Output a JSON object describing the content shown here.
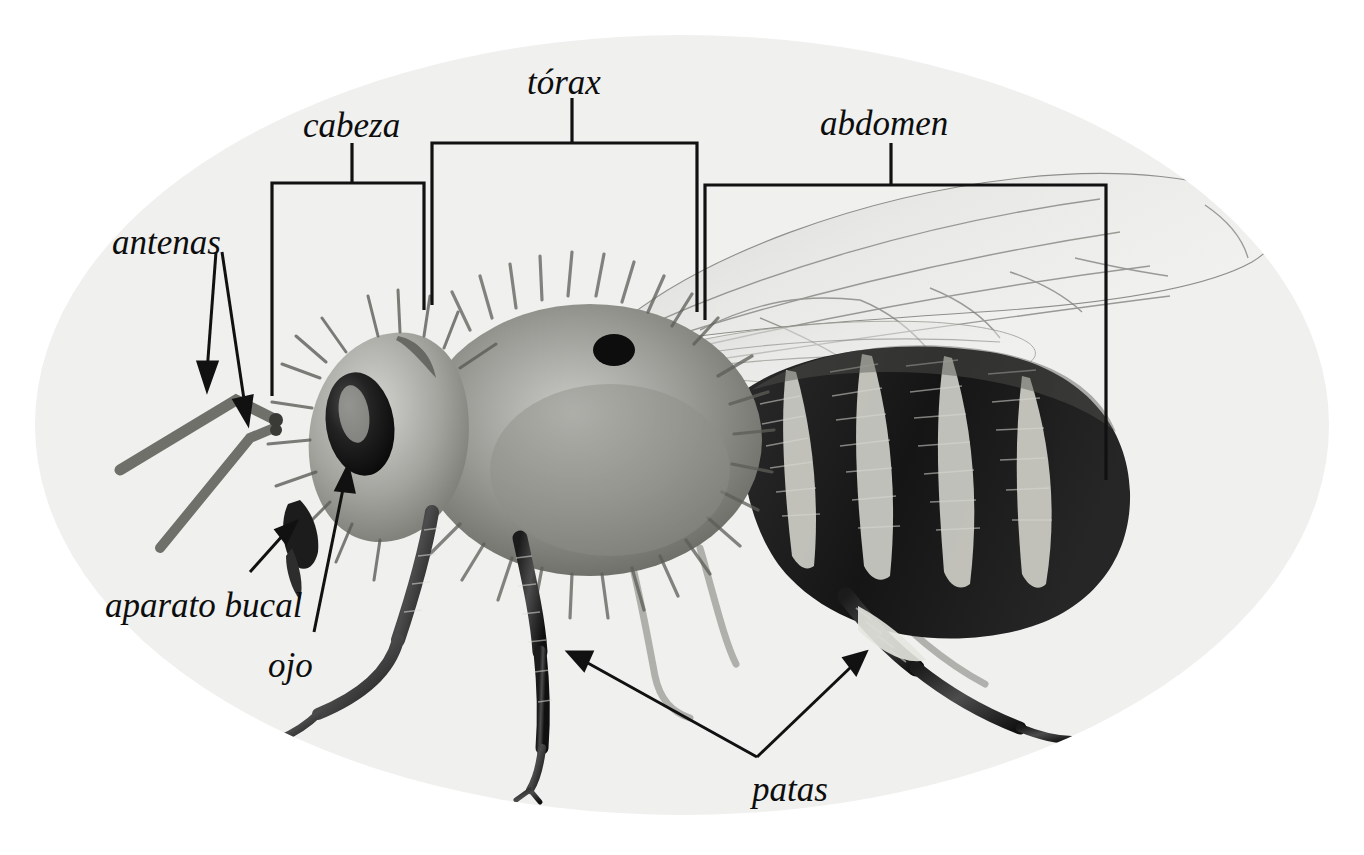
{
  "figure": {
    "background_color": "#ffffff",
    "oval_fill": "#f0f0ef",
    "line_color": "#111111",
    "text_color": "#0d0d0d"
  },
  "labels": [
    {
      "id": "antenas",
      "text": "antenas",
      "x": 112,
      "y": 225,
      "connector": "double-arrow"
    },
    {
      "id": "cabeza",
      "text": "cabeza",
      "x": 303,
      "y": 108,
      "connector": "bracket"
    },
    {
      "id": "torax",
      "text": "tórax",
      "x": 527,
      "y": 65,
      "connector": "bracket"
    },
    {
      "id": "abdomen",
      "text": "abdomen",
      "x": 820,
      "y": 106,
      "connector": "bracket"
    },
    {
      "id": "aparato-bucal",
      "text": "aparato bucal",
      "x": 105,
      "y": 588,
      "connector": "arrow"
    },
    {
      "id": "ojo",
      "text": "ojo",
      "x": 268,
      "y": 648,
      "connector": "arrow"
    },
    {
      "id": "patas",
      "text": "patas",
      "x": 752,
      "y": 772,
      "connector": "double-arrow"
    }
  ],
  "brackets": {
    "cabeza": {
      "left_x": 272,
      "right_x": 424,
      "top_y": 183,
      "left_bottom_y": 396,
      "right_bottom_y": 310,
      "stem_x": 352,
      "stem_top_y": 143
    },
    "torax": {
      "left_x": 432,
      "right_x": 697,
      "top_y": 143,
      "left_bottom_y": 305,
      "right_bottom_y": 312,
      "stem_x": 572,
      "stem_top_y": 98
    },
    "abdomen": {
      "left_x": 705,
      "right_x": 1106,
      "top_y": 185,
      "left_bottom_y": 320,
      "right_bottom_y": 480,
      "stem_x": 891,
      "stem_top_y": 143
    }
  },
  "arrows": {
    "antenas": [
      {
        "from_x": 215,
        "from_y": 250,
        "to_x": 208,
        "to_y": 380
      },
      {
        "from_x": 222,
        "from_y": 250,
        "to_x": 247,
        "to_y": 415
      }
    ],
    "aparato_bucal": {
      "from_x": 252,
      "from_y": 570,
      "to_x": 290,
      "to_y": 528
    },
    "ojo": {
      "from_x": 313,
      "from_y": 630,
      "to_x": 345,
      "to_y": 470
    },
    "patas": [
      {
        "from_x": 757,
        "from_y": 757,
        "to_x": 570,
        "to_y": 653
      },
      {
        "from_x": 757,
        "from_y": 757,
        "to_x": 860,
        "to_y": 655
      }
    ]
  },
  "anatomy_parts": [
    "antenas",
    "cabeza",
    "ojo",
    "aparato bucal",
    "tórax",
    "abdomen",
    "patas"
  ]
}
